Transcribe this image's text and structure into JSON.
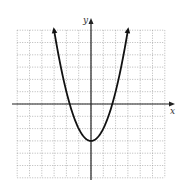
{
  "chart_data": {
    "type": "line",
    "title": "",
    "xlabel": "x",
    "ylabel": "y",
    "function": "y = x^2 - 3",
    "xlim": [
      -5,
      5
    ],
    "ylim": [
      -6,
      6
    ],
    "grid": true,
    "grid_style": "dotted",
    "tick_labels": false,
    "vertex": [
      0,
      -3
    ],
    "roots": [
      -1.73,
      1.73
    ],
    "endpoints_with_arrows": [
      [
        -3,
        6
      ],
      [
        3,
        6
      ]
    ],
    "x": [
      -3,
      -2.5,
      -2,
      -1.5,
      -1,
      -0.5,
      0,
      0.5,
      1,
      1.5,
      2,
      2.5,
      3
    ],
    "series": [
      {
        "name": "parabola",
        "values": [
          6,
          3.25,
          1,
          -0.75,
          -2,
          -2.75,
          -3,
          -2.75,
          -2,
          -0.75,
          1,
          3.25,
          6
        ]
      }
    ]
  },
  "labels": {
    "x_axis": "x",
    "y_axis": "y"
  },
  "colors": {
    "grid": "#9a9a9a",
    "axis": "#222222",
    "curve": "#111111",
    "background": "#ffffff"
  }
}
